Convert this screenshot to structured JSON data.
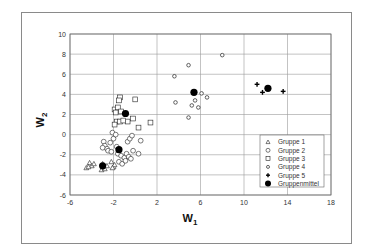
{
  "chart_data": {
    "type": "scatter",
    "title": "",
    "xlabel": "W",
    "xlabel_sub": "1",
    "ylabel": "W",
    "ylabel_sub": "2",
    "xlim": [
      -6,
      18
    ],
    "ylim": [
      -6,
      10
    ],
    "xticks": [
      -6,
      -2,
      2,
      6,
      10,
      14,
      18
    ],
    "yticks": [
      -6,
      -4,
      -2,
      0,
      2,
      4,
      6,
      8,
      10
    ],
    "grid": true,
    "legend_position": "lower right (inside plot)",
    "series": [
      {
        "name": "Gruppe 1",
        "marker": "triangle",
        "points": [
          [
            -4.5,
            -3.3
          ],
          [
            -4.2,
            -2.8
          ],
          [
            -4.0,
            -3.1
          ],
          [
            -3.8,
            -2.9
          ],
          [
            -4.3,
            -3.2
          ],
          [
            -3.1,
            -3.5
          ],
          [
            -3.0,
            -2.9
          ],
          [
            -2.8,
            -3.4
          ],
          [
            -2.2,
            -2.7
          ],
          [
            -2.0,
            -3.2
          ],
          [
            -1.9,
            -3.0
          ],
          [
            -2.1,
            -3.3
          ],
          [
            -2.6,
            -3.1
          ]
        ]
      },
      {
        "name": "Gruppe 2",
        "marker": "circle",
        "points": [
          [
            -2.9,
            -0.7
          ],
          [
            -2.8,
            -1.1
          ],
          [
            -2.6,
            -1.4
          ],
          [
            -3.0,
            -1.3
          ],
          [
            -2.3,
            -0.8
          ],
          [
            -2.5,
            -1.6
          ],
          [
            -2.0,
            -0.4
          ],
          [
            -2.1,
            0.2
          ],
          [
            -1.8,
            0.0
          ],
          [
            -2.2,
            -1.7
          ],
          [
            -1.6,
            -1.9
          ],
          [
            -1.3,
            -2.1
          ],
          [
            -1.0,
            -2.3
          ],
          [
            -0.8,
            -1.9
          ],
          [
            -0.6,
            -2.2
          ],
          [
            -0.4,
            -2.4
          ],
          [
            -0.7,
            -0.7
          ],
          [
            -0.5,
            -0.4
          ],
          [
            -0.3,
            -0.1
          ],
          [
            0.5,
            -0.6
          ],
          [
            0.3,
            -1.9
          ],
          [
            -1.5,
            -2.7
          ],
          [
            -1.2,
            -2.9
          ],
          [
            -0.9,
            -2.6
          ],
          [
            -1.7,
            -1.2
          ],
          [
            -0.2,
            -1.6
          ]
        ]
      },
      {
        "name": "Gruppe 3",
        "marker": "square",
        "points": [
          [
            -1.4,
            3.7
          ],
          [
            -1.5,
            3.4
          ],
          [
            -1.9,
            2.5
          ],
          [
            -1.6,
            2.7
          ],
          [
            -1.3,
            2.3
          ],
          [
            -1.8,
            2.2
          ],
          [
            -1.7,
            1.3
          ],
          [
            -1.9,
            1.0
          ],
          [
            -1.4,
            1.3
          ],
          [
            -0.7,
            1.3
          ],
          [
            -0.2,
            1.6
          ],
          [
            0.0,
            3.5
          ],
          [
            0.3,
            0.7
          ],
          [
            1.4,
            1.2
          ],
          [
            -1.1,
            1.4
          ]
        ]
      },
      {
        "name": "Gruppe 4",
        "marker": "diamond",
        "points": [
          [
            8.0,
            7.9
          ],
          [
            4.9,
            6.9
          ],
          [
            3.6,
            5.8
          ],
          [
            3.7,
            3.2
          ],
          [
            5.2,
            2.9
          ],
          [
            5.5,
            3.4
          ],
          [
            6.1,
            4.1
          ],
          [
            6.6,
            3.7
          ],
          [
            5.8,
            2.7
          ],
          [
            4.9,
            1.7
          ]
        ]
      },
      {
        "name": "Gruppe 5",
        "marker": "plus",
        "points": [
          [
            11.2,
            5.0
          ],
          [
            11.7,
            4.2
          ],
          [
            13.6,
            4.3
          ]
        ]
      },
      {
        "name": "Gruppenmittel",
        "marker": "filled-circle",
        "points": [
          [
            -3.0,
            -3.1
          ],
          [
            -1.5,
            -1.5
          ],
          [
            -0.9,
            2.1
          ],
          [
            5.4,
            4.2
          ],
          [
            12.2,
            4.6
          ]
        ]
      }
    ]
  },
  "labels": {
    "x_main": "W",
    "x_sub": "1",
    "y_main": "W",
    "y_sub": "2"
  },
  "legend": {
    "items": [
      {
        "label": "Gruppe 1",
        "marker": "triangle"
      },
      {
        "label": "Gruppe 2",
        "marker": "circle"
      },
      {
        "label": "Gruppe 3",
        "marker": "square"
      },
      {
        "label": "Gruppe 4",
        "marker": "diamond"
      },
      {
        "label": "Gruppe 5",
        "marker": "plus"
      },
      {
        "label": "Gruppenmittel",
        "marker": "filled-circle"
      }
    ]
  },
  "colors": {
    "marker_stroke": "#222222",
    "marker_fill_mean": "#000000",
    "grid": "#9a9a9a",
    "axis": "#666666",
    "frame": "#8a8a8a"
  }
}
